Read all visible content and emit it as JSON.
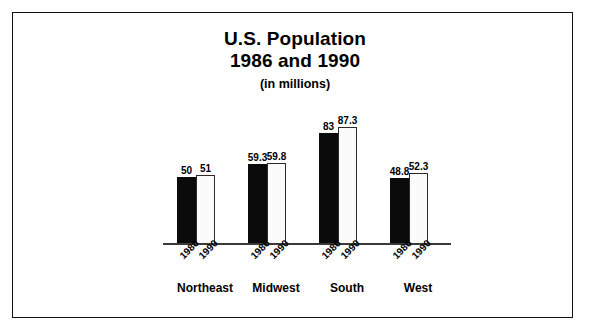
{
  "figure": {
    "title_line1": "U.S. Population",
    "title_line2": "1986 and 1990",
    "subtitle": "(in millions)"
  },
  "chart_data": {
    "type": "bar",
    "title": "U.S. Population 1986 and 1990",
    "subtitle": "(in millions)",
    "xlabel": "",
    "ylabel": "",
    "ylim": [
      0,
      100
    ],
    "grid": false,
    "legend": "none",
    "categories": [
      "Northeast",
      "Midwest",
      "South",
      "West"
    ],
    "series": [
      {
        "name": "1986",
        "style": "solid-black",
        "color": "#0b0b0b",
        "values": [
          50,
          59.3,
          83,
          48.8
        ],
        "labels": [
          "50",
          "59.3",
          "83",
          "48.8"
        ]
      },
      {
        "name": "1990",
        "style": "hollow-white",
        "color": "#fbfbfb",
        "values": [
          51,
          59.8,
          87.3,
          52.3
        ],
        "labels": [
          "51",
          "59.8",
          "87.3",
          "52.3"
        ]
      }
    ],
    "groups": [
      {
        "category": "Northeast",
        "bars": [
          {
            "year": "1986",
            "value": 50,
            "label": "50"
          },
          {
            "year": "1990",
            "value": 51,
            "label": "51"
          }
        ]
      },
      {
        "category": "Midwest",
        "bars": [
          {
            "year": "1986",
            "value": 59.3,
            "label": "59.3"
          },
          {
            "year": "1990",
            "value": 59.8,
            "label": "59.8"
          }
        ]
      },
      {
        "category": "South",
        "bars": [
          {
            "year": "1986",
            "value": 83,
            "label": "83"
          },
          {
            "year": "1990",
            "value": 87.3,
            "label": "87.3"
          }
        ]
      },
      {
        "category": "West",
        "bars": [
          {
            "year": "1986",
            "value": 48.8,
            "label": "48.8"
          },
          {
            "year": "1990",
            "value": 52.3,
            "label": "52.3"
          }
        ]
      }
    ]
  }
}
